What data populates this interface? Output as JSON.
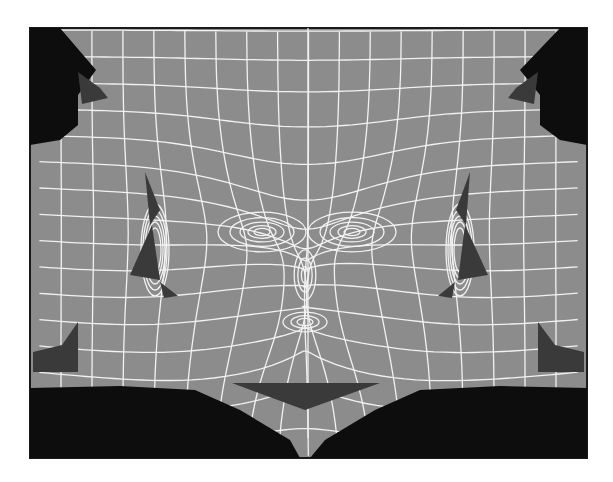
{
  "figure": {
    "frame": {
      "x": 30,
      "y": 28,
      "w": 557,
      "h": 430
    },
    "colors": {
      "background": "#ffffff",
      "frame_border": "#1a1a1a",
      "uv_fill": "#8c8c8c",
      "empty_region": "#0d0d0d",
      "backface_fill": "#3a3a3a",
      "wire": "#f2f2f2"
    },
    "regions": {
      "empty": [
        "30,28 60,28 96,70 78,95 78,125 60,140 30,145",
        "587,28 560,28 520,70 540,95 540,125 560,140 587,145",
        "30,388 120,386 195,390 240,410 290,440 300,458 30,458",
        "587,388 500,386 420,390 375,410 325,440 310,458 587,458"
      ],
      "backfaces": [
        "78,72 100,88 108,98 82,104",
        "538,72 516,88 508,98 534,104",
        "145,172 160,210 150,225",
        "152,225 130,275 160,280",
        "160,282 178,296 164,298",
        "470,172 456,210 466,225",
        "465,225 488,275 458,280",
        "455,282 438,296 452,298",
        "33,352 62,345 78,322 78,372 33,372",
        "584,352 555,345 538,322 538,372 584,372",
        "232,383 380,383 305,410"
      ]
    },
    "mesh": {
      "center_x": 308,
      "rows": 16,
      "cols": 18,
      "eyes": [
        {
          "cx": 262,
          "cy": 232
        },
        {
          "cx": 352,
          "cy": 232
        }
      ],
      "ears": [
        {
          "cx": 155,
          "cy": 250
        },
        {
          "cx": 460,
          "cy": 250
        }
      ],
      "nose": {
        "cx": 305,
        "cy": 275
      },
      "mouth": {
        "cx": 305,
        "cy": 322
      },
      "chin": {
        "cx": 305,
        "cy": 352
      }
    }
  }
}
